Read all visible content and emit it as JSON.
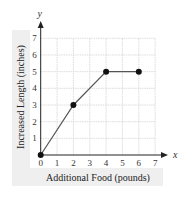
{
  "chart_data": {
    "type": "line",
    "title": "",
    "xlabel": "Additional Food (pounds)",
    "ylabel": "Increased Length (inches)",
    "x_axis_var": "x",
    "y_axis_var": "y",
    "xlim": [
      0,
      7
    ],
    "ylim": [
      0,
      7
    ],
    "x_ticks": [
      "0",
      "1",
      "2",
      "3",
      "4",
      "5",
      "6",
      "7"
    ],
    "y_ticks": [
      "1",
      "2",
      "3",
      "4",
      "5",
      "6",
      "7"
    ],
    "grid": true,
    "legend": null,
    "series": [
      {
        "name": "growth",
        "points": [
          {
            "x": 0,
            "y": 0
          },
          {
            "x": 2,
            "y": 3
          },
          {
            "x": 4,
            "y": 5
          },
          {
            "x": 6,
            "y": 5
          }
        ],
        "markers": true,
        "color": "#333333"
      }
    ]
  },
  "colors": {
    "panel": "#efefef",
    "grid": "#d4d4d4",
    "axis": "#222222",
    "line": "#555555",
    "marker": "#111111"
  }
}
